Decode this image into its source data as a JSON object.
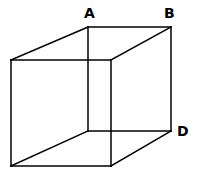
{
  "diagram": {
    "type": "wireframe-cube",
    "line_color": "#000000",
    "background": "#ffffff",
    "vertices": {
      "front_top_left": [
        11,
        60
      ],
      "front_top_right": [
        111,
        60
      ],
      "front_bottom_right": [
        111,
        166
      ],
      "front_bottom_left": [
        11,
        166
      ],
      "back_top_left": [
        88,
        27
      ],
      "back_top_right": [
        171,
        27
      ],
      "back_bottom_right": [
        171,
        131
      ],
      "back_bottom_left": [
        88,
        131
      ]
    },
    "labels": {
      "a": {
        "text": "A",
        "vertex": "back_top_left"
      },
      "b": {
        "text": "B",
        "vertex": "back_top_right"
      },
      "d": {
        "text": "D",
        "vertex": "back_bottom_right"
      }
    }
  }
}
